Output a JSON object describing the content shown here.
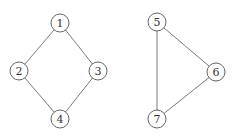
{
  "graphs": [
    {
      "name": "cycle-graph-4",
      "nodes": [
        {
          "id": "1",
          "label": "1",
          "x": 60,
          "y": 23
        },
        {
          "id": "2",
          "label": "2",
          "x": 19,
          "y": 71
        },
        {
          "id": "3",
          "label": "3",
          "x": 98,
          "y": 71
        },
        {
          "id": "4",
          "label": "4",
          "x": 60,
          "y": 119
        }
      ],
      "edges": [
        [
          "1",
          "2"
        ],
        [
          "1",
          "3"
        ],
        [
          "2",
          "4"
        ],
        [
          "3",
          "4"
        ]
      ]
    },
    {
      "name": "triangle-graph",
      "nodes": [
        {
          "id": "5",
          "label": "5",
          "x": 157,
          "y": 22
        },
        {
          "id": "6",
          "label": "6",
          "x": 216,
          "y": 72
        },
        {
          "id": "7",
          "label": "7",
          "x": 157,
          "y": 119
        }
      ],
      "edges": [
        [
          "5",
          "6"
        ],
        [
          "5",
          "7"
        ],
        [
          "6",
          "7"
        ]
      ]
    }
  ],
  "node_radius": 9,
  "colors": {
    "edge": "#6b6b6b",
    "node_stroke": "#555555",
    "node_fill": "#ffffff",
    "label": "#333333"
  }
}
